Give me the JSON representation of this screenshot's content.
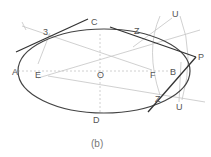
{
  "figure": {
    "caption": "(b)",
    "labels": {
      "A": "A",
      "B": "B",
      "C": "C",
      "D": "D",
      "E": "E",
      "F": "F",
      "O": "O",
      "P": "P",
      "three": "3",
      "Z_top": "Z",
      "Z_bottom": "Z",
      "U_top": "U",
      "U_bottom": "U"
    },
    "colors": {
      "curve": "#444444",
      "tangent": "#333333",
      "construction": "#bbbbbb",
      "label": "#555555"
    }
  }
}
